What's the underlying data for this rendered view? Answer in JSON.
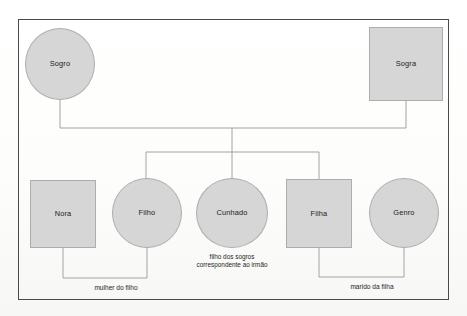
{
  "diagram": {
    "language": "pt",
    "frame": {
      "border_color": "#4a4a4a"
    },
    "style": {
      "node_fill": "#d6d6d6",
      "node_border": "#adadad",
      "line_color": "#9a9a9a",
      "text_color": "#1a1a1a",
      "background": "#fdfdfc"
    },
    "nodes": [
      {
        "id": "sogro",
        "label": "Sogro",
        "shape": "circle",
        "row": "top",
        "x": 25,
        "y": 28,
        "w": 70,
        "h": 72
      },
      {
        "id": "sogra",
        "label": "Sogra",
        "shape": "square",
        "row": "top",
        "x": 369,
        "y": 27,
        "w": 74,
        "h": 74
      },
      {
        "id": "nora",
        "label": "Nora",
        "shape": "square",
        "row": "bottom",
        "x": 30,
        "y": 180,
        "w": 66,
        "h": 68
      },
      {
        "id": "filho",
        "label": "Filho",
        "shape": "circle",
        "row": "bottom",
        "x": 112,
        "y": 178,
        "w": 70,
        "h": 70
      },
      {
        "id": "cunhado",
        "label": "Cunhado",
        "shape": "circle",
        "row": "bottom",
        "x": 196,
        "y": 178,
        "w": 72,
        "h": 70
      },
      {
        "id": "filha",
        "label": "Filha",
        "shape": "square",
        "row": "bottom",
        "x": 286,
        "y": 179,
        "w": 66,
        "h": 69
      },
      {
        "id": "genro",
        "label": "Genro",
        "shape": "circle",
        "row": "bottom",
        "x": 369,
        "y": 178,
        "w": 70,
        "h": 70
      }
    ],
    "captions": [
      {
        "id": "cunhado-caption",
        "for": "cunhado",
        "lines": [
          "filho dos sogros",
          "correspondente ao irmão"
        ],
        "x": 232,
        "y": 253
      }
    ],
    "edge_labels": [
      {
        "id": "mulher-do-filho",
        "text": "mulher do filho",
        "connects": [
          "nora",
          "filho"
        ],
        "x": 116,
        "y": 285
      },
      {
        "id": "marido-da-filha",
        "text": "marido da filha",
        "connects": [
          "filha",
          "genro"
        ],
        "x": 372,
        "y": 284
      }
    ],
    "connectors": [
      {
        "id": "sogro-drop",
        "from": "sogro",
        "to": "parents-bar"
      },
      {
        "id": "sogra-drop",
        "from": "sogra",
        "to": "parents-bar"
      },
      {
        "id": "parents-bar",
        "from": "sogro",
        "to": "sogra"
      },
      {
        "id": "parents-stem",
        "from": "parents-bar",
        "to": "children-bar"
      },
      {
        "id": "children-bar",
        "from": "filho",
        "to": "filha"
      },
      {
        "id": "filho-drop",
        "from": "children-bar",
        "to": "filho"
      },
      {
        "id": "cunhado-drop",
        "from": "children-bar",
        "to": "cunhado"
      },
      {
        "id": "filha-drop",
        "from": "children-bar",
        "to": "filha"
      },
      {
        "id": "nora-filho-link",
        "from": "nora",
        "to": "filho"
      },
      {
        "id": "filha-genro-link",
        "from": "filha",
        "to": "genro"
      }
    ]
  }
}
